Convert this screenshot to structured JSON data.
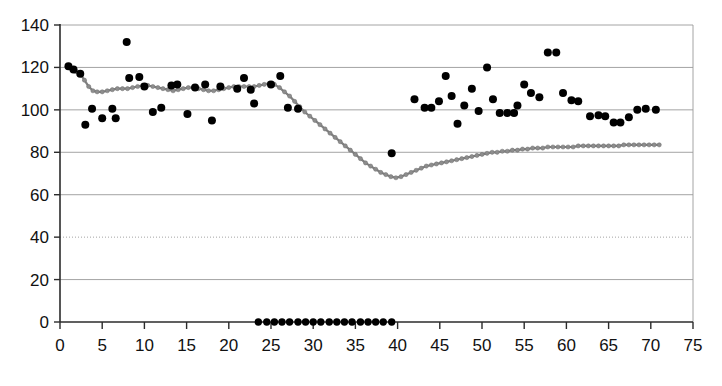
{
  "chart_data": {
    "type": "scatter",
    "title": "",
    "subtitle": "",
    "xlabel": "",
    "ylabel": "",
    "xlim": [
      0,
      75
    ],
    "ylim": [
      0,
      140
    ],
    "xticks": [
      0,
      5,
      10,
      15,
      20,
      25,
      30,
      35,
      40,
      45,
      50,
      55,
      60,
      65,
      70,
      75
    ],
    "yticks": [
      0,
      20,
      40,
      60,
      80,
      100,
      120,
      140
    ],
    "xtick_labels": [
      "0",
      "5",
      "10",
      "15",
      "20",
      "25",
      "30",
      "35",
      "40",
      "45",
      "50",
      "55",
      "60",
      "65",
      "70",
      "75"
    ],
    "ytick_labels": [
      "0",
      "20",
      "40",
      "60",
      "80",
      "100",
      "120",
      "140"
    ],
    "grid": true,
    "grid_axis": "y",
    "legend": false,
    "legend_position": "none",
    "colors": {
      "scatter": "#000000",
      "line": "#808080",
      "line_marker": "#8d8d8d",
      "grid": "#9a9a9a",
      "axis": "#2b2b2b",
      "background": "#ffffff",
      "text": "#111111"
    },
    "series": [
      {
        "name": "observed-scatter",
        "type": "scatter",
        "marker": "circle",
        "color": "#000000",
        "points": [
          [
            1.0,
            120.5
          ],
          [
            1.6,
            119.0
          ],
          [
            2.4,
            117.0
          ],
          [
            3.0,
            93.0
          ],
          [
            3.8,
            100.5
          ],
          [
            5.0,
            96.0
          ],
          [
            6.2,
            100.5
          ],
          [
            6.6,
            96.0
          ],
          [
            7.9,
            132.0
          ],
          [
            8.2,
            115.0
          ],
          [
            9.4,
            115.5
          ],
          [
            10.0,
            111.0
          ],
          [
            11.0,
            99.0
          ],
          [
            12.0,
            101.0
          ],
          [
            13.2,
            111.5
          ],
          [
            13.9,
            112.0
          ],
          [
            15.1,
            98.0
          ],
          [
            16.0,
            110.5
          ],
          [
            17.2,
            112.0
          ],
          [
            18.0,
            95.0
          ],
          [
            19.0,
            111.0
          ],
          [
            21.0,
            110.0
          ],
          [
            21.8,
            115.0
          ],
          [
            22.6,
            109.5
          ],
          [
            23.0,
            103.0
          ],
          [
            25.0,
            112.0
          ],
          [
            26.1,
            116.0
          ],
          [
            27.0,
            101.0
          ],
          [
            28.2,
            100.5
          ],
          [
            39.3,
            79.5
          ],
          [
            42.0,
            105.0
          ],
          [
            43.2,
            101.0
          ],
          [
            44.0,
            101.0
          ],
          [
            44.9,
            104.0
          ],
          [
            45.7,
            116.0
          ],
          [
            46.4,
            106.5
          ],
          [
            47.1,
            93.5
          ],
          [
            47.9,
            102.0
          ],
          [
            48.8,
            110.0
          ],
          [
            49.6,
            99.5
          ],
          [
            50.6,
            120.0
          ],
          [
            51.3,
            105.0
          ],
          [
            52.1,
            98.5
          ],
          [
            53.0,
            98.5
          ],
          [
            53.8,
            98.5
          ],
          [
            54.2,
            102.0
          ],
          [
            55.0,
            112.0
          ],
          [
            55.8,
            108.0
          ],
          [
            56.8,
            106.0
          ],
          [
            57.8,
            127.0
          ],
          [
            58.8,
            127.0
          ],
          [
            59.6,
            108.0
          ],
          [
            60.6,
            104.5
          ],
          [
            61.4,
            104.0
          ],
          [
            62.8,
            97.0
          ],
          [
            63.8,
            97.5
          ],
          [
            64.6,
            97.0
          ],
          [
            65.6,
            94.0
          ],
          [
            66.4,
            94.0
          ],
          [
            67.4,
            96.5
          ],
          [
            68.4,
            100.0
          ],
          [
            69.4,
            100.5
          ],
          [
            70.6,
            100.0
          ]
        ]
      },
      {
        "name": "zero-baseline-points",
        "type": "scatter",
        "marker": "circle",
        "color": "#000000",
        "points": [
          [
            23.5,
            0
          ],
          [
            24.5,
            0
          ],
          [
            25.4,
            0
          ],
          [
            26.3,
            0
          ],
          [
            27.2,
            0
          ],
          [
            28.2,
            0
          ],
          [
            29.1,
            0
          ],
          [
            30.0,
            0
          ],
          [
            30.9,
            0
          ],
          [
            31.9,
            0
          ],
          [
            32.8,
            0
          ],
          [
            33.7,
            0
          ],
          [
            34.6,
            0
          ],
          [
            35.6,
            0
          ],
          [
            36.5,
            0
          ],
          [
            37.4,
            0
          ],
          [
            38.3,
            0
          ],
          [
            39.3,
            0
          ]
        ]
      },
      {
        "name": "fitted-trend-line",
        "type": "line",
        "marker": "circle",
        "color": "#808080",
        "points": [
          [
            0.9,
            120.0
          ],
          [
            1.4,
            119.0
          ],
          [
            1.9,
            118.0
          ],
          [
            2.4,
            117.0
          ],
          [
            2.9,
            114.0
          ],
          [
            3.4,
            111.0
          ],
          [
            3.9,
            109.0
          ],
          [
            4.4,
            108.5
          ],
          [
            5.0,
            108.5
          ],
          [
            5.6,
            109.0
          ],
          [
            6.2,
            109.5
          ],
          [
            6.8,
            110.0
          ],
          [
            7.4,
            110.0
          ],
          [
            8.0,
            110.0
          ],
          [
            8.6,
            110.5
          ],
          [
            9.2,
            111.0
          ],
          [
            9.8,
            111.5
          ],
          [
            10.4,
            111.5
          ],
          [
            11.0,
            111.0
          ],
          [
            11.6,
            110.5
          ],
          [
            12.2,
            110.0
          ],
          [
            12.8,
            109.5
          ],
          [
            13.4,
            109.0
          ],
          [
            14.0,
            109.5
          ],
          [
            14.6,
            110.0
          ],
          [
            15.2,
            110.5
          ],
          [
            15.8,
            110.5
          ],
          [
            16.4,
            110.0
          ],
          [
            17.0,
            109.5
          ],
          [
            17.6,
            109.0
          ],
          [
            18.2,
            109.0
          ],
          [
            18.8,
            109.5
          ],
          [
            19.4,
            110.0
          ],
          [
            20.0,
            110.5
          ],
          [
            20.6,
            111.0
          ],
          [
            21.2,
            111.0
          ],
          [
            21.8,
            111.0
          ],
          [
            22.4,
            111.0
          ],
          [
            23.0,
            111.0
          ],
          [
            23.6,
            111.5
          ],
          [
            24.2,
            112.0
          ],
          [
            24.8,
            112.5
          ],
          [
            25.4,
            112.0
          ],
          [
            26.0,
            110.5
          ],
          [
            26.6,
            108.5
          ],
          [
            27.2,
            106.5
          ],
          [
            27.8,
            104.0
          ],
          [
            28.4,
            101.5
          ],
          [
            29.0,
            99.0
          ],
          [
            29.6,
            97.0
          ],
          [
            30.2,
            95.0
          ],
          [
            30.8,
            93.0
          ],
          [
            31.4,
            91.0
          ],
          [
            32.0,
            89.0
          ],
          [
            32.6,
            87.0
          ],
          [
            33.2,
            85.0
          ],
          [
            33.8,
            83.0
          ],
          [
            34.4,
            81.0
          ],
          [
            35.0,
            79.0
          ],
          [
            35.6,
            77.0
          ],
          [
            36.2,
            75.0
          ],
          [
            36.8,
            73.5
          ],
          [
            37.4,
            72.0
          ],
          [
            38.0,
            70.5
          ],
          [
            38.6,
            69.5
          ],
          [
            39.2,
            68.5
          ],
          [
            39.8,
            68.0
          ],
          [
            40.4,
            68.5
          ],
          [
            41.0,
            69.5
          ],
          [
            41.6,
            70.5
          ],
          [
            42.2,
            71.5
          ],
          [
            42.8,
            72.5
          ],
          [
            43.4,
            73.5
          ],
          [
            44.0,
            74.0
          ],
          [
            44.6,
            74.5
          ],
          [
            45.2,
            75.0
          ],
          [
            45.8,
            75.5
          ],
          [
            46.4,
            76.0
          ],
          [
            47.0,
            76.5
          ],
          [
            47.6,
            77.0
          ],
          [
            48.2,
            77.5
          ],
          [
            48.8,
            78.0
          ],
          [
            49.4,
            78.5
          ],
          [
            50.0,
            79.0
          ],
          [
            50.6,
            79.5
          ],
          [
            51.2,
            80.0
          ],
          [
            51.8,
            80.0
          ],
          [
            52.4,
            80.5
          ],
          [
            53.0,
            80.5
          ],
          [
            53.6,
            81.0
          ],
          [
            54.2,
            81.0
          ],
          [
            54.8,
            81.5
          ],
          [
            55.4,
            81.5
          ],
          [
            56.0,
            82.0
          ],
          [
            56.6,
            82.0
          ],
          [
            57.2,
            82.0
          ],
          [
            57.8,
            82.5
          ],
          [
            58.4,
            82.5
          ],
          [
            59.0,
            82.5
          ],
          [
            59.6,
            82.5
          ],
          [
            60.2,
            82.5
          ],
          [
            60.8,
            82.5
          ],
          [
            61.4,
            83.0
          ],
          [
            62.0,
            83.0
          ],
          [
            62.6,
            83.0
          ],
          [
            63.2,
            83.0
          ],
          [
            63.8,
            83.0
          ],
          [
            64.4,
            83.0
          ],
          [
            65.0,
            83.0
          ],
          [
            65.6,
            83.0
          ],
          [
            66.2,
            83.0
          ],
          [
            66.8,
            83.5
          ],
          [
            67.4,
            83.5
          ],
          [
            68.0,
            83.5
          ],
          [
            68.6,
            83.5
          ],
          [
            69.2,
            83.5
          ],
          [
            69.8,
            83.5
          ],
          [
            70.4,
            83.5
          ],
          [
            71.0,
            83.5
          ]
        ]
      }
    ]
  },
  "plot_geometry": {
    "left": 60,
    "right": 693,
    "top": 25,
    "bottom": 322
  }
}
